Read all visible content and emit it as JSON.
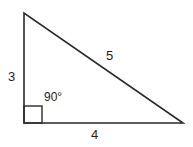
{
  "diagram": {
    "type": "right-triangle",
    "stroke_color": "#2a2a2a",
    "background_color": "#ffffff",
    "vertices": {
      "top": [
        24,
        13
      ],
      "right_angle": [
        24,
        123
      ],
      "right": [
        183,
        123
      ]
    },
    "labels": {
      "vertical_side": "3",
      "horizontal_side": "4",
      "hypotenuse": "5",
      "right_angle": "90°"
    }
  }
}
